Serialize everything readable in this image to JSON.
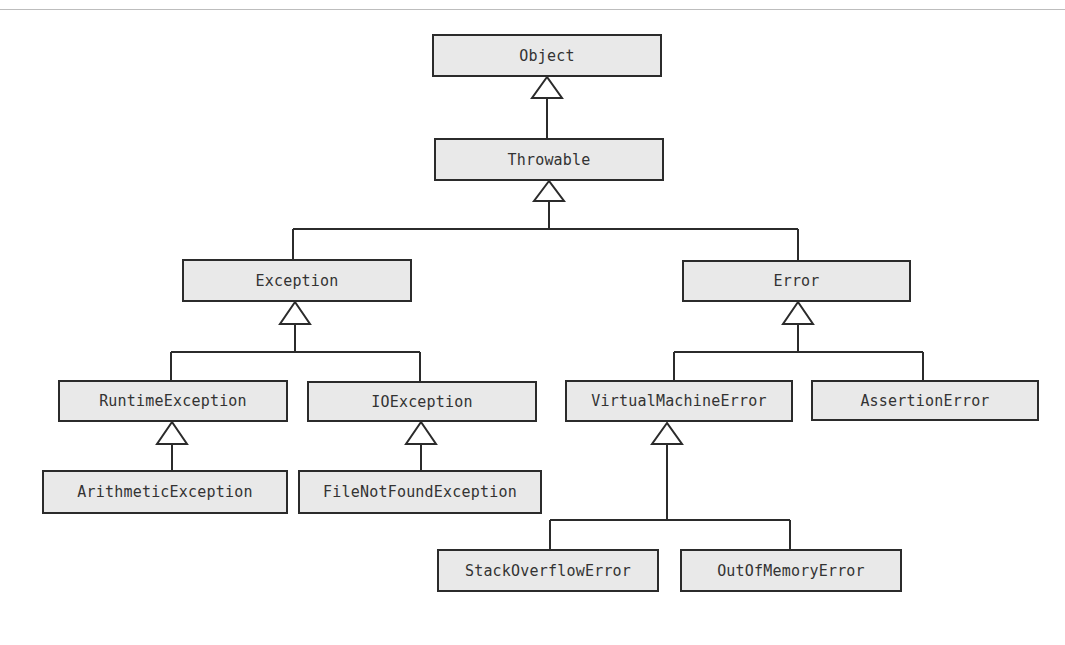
{
  "diagram": {
    "type": "uml-class-hierarchy",
    "colors": {
      "box_fill": "#e9e9e9",
      "box_border": "#2b2b2b",
      "text": "#333333",
      "line": "#2b2b2b",
      "background": "#ffffff"
    },
    "classes": {
      "object": {
        "label": "Object"
      },
      "throwable": {
        "label": "Throwable"
      },
      "exception": {
        "label": "Exception"
      },
      "error": {
        "label": "Error"
      },
      "runtime_exception": {
        "label": "RuntimeException"
      },
      "io_exception": {
        "label": "IOException"
      },
      "virtual_machine_error": {
        "label": "VirtualMachineError"
      },
      "assertion_error": {
        "label": "AssertionError"
      },
      "arithmetic_exception": {
        "label": "ArithmeticException"
      },
      "file_not_found_exception": {
        "label": "FileNotFoundException"
      },
      "stack_overflow_error": {
        "label": "StackOverflowError"
      },
      "out_of_memory_error": {
        "label": "OutOfMemoryError"
      }
    },
    "inheritance": [
      {
        "child": "Throwable",
        "parent": "Object"
      },
      {
        "child": "Exception",
        "parent": "Throwable"
      },
      {
        "child": "Error",
        "parent": "Throwable"
      },
      {
        "child": "RuntimeException",
        "parent": "Exception"
      },
      {
        "child": "IOException",
        "parent": "Exception"
      },
      {
        "child": "VirtualMachineError",
        "parent": "Error"
      },
      {
        "child": "AssertionError",
        "parent": "Error"
      },
      {
        "child": "ArithmeticException",
        "parent": "RuntimeException"
      },
      {
        "child": "FileNotFoundException",
        "parent": "IOException"
      },
      {
        "child": "StackOverflowError",
        "parent": "VirtualMachineError"
      },
      {
        "child": "OutOfMemoryError",
        "parent": "VirtualMachineError"
      }
    ]
  }
}
